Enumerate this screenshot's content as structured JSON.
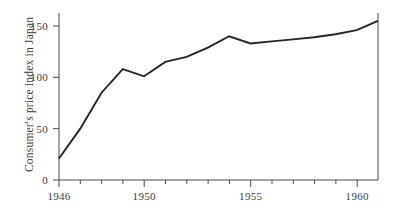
{
  "chart_data": {
    "type": "line",
    "title": "",
    "xlabel": "",
    "ylabel": "Consumer's price index in Japan",
    "x": [
      1946,
      1947,
      1948,
      1949,
      1950,
      1951,
      1952,
      1953,
      1954,
      1955,
      1956,
      1957,
      1958,
      1959,
      1960,
      1961
    ],
    "values": [
      21,
      50,
      85,
      108,
      101,
      115,
      120,
      129,
      140,
      133,
      135,
      137,
      139,
      142,
      146,
      155
    ],
    "series": [
      {
        "name": "Consumer's price index in Japan",
        "values": [
          21,
          50,
          85,
          108,
          101,
          115,
          120,
          129,
          140,
          133,
          135,
          137,
          139,
          142,
          146,
          155
        ]
      }
    ],
    "xlim": [
      1946,
      1961
    ],
    "ylim": [
      0,
      165
    ],
    "x_ticks_all": [
      1946,
      1947,
      1948,
      1949,
      1950,
      1951,
      1952,
      1953,
      1954,
      1955,
      1956,
      1957,
      1958,
      1959,
      1960,
      1961
    ],
    "x_tick_labels": [
      "1946",
      "1950",
      "1955",
      "1960"
    ],
    "x_tick_label_values": [
      1946,
      1950,
      1955,
      1960
    ],
    "y_ticks": [
      0,
      50,
      100,
      150
    ],
    "y_tick_labels": [
      "0",
      "50",
      "100",
      "150"
    ],
    "grid": false,
    "legend": false,
    "legend_position": "none",
    "line_color": "#262626",
    "axis_color": "#4a4a4a"
  },
  "axis": {
    "y_label": "Consumer's price index in Japan",
    "y_tick_0": "0",
    "y_tick_1": "50",
    "y_tick_2": "100",
    "y_tick_3": "150",
    "x_tick_0": "1946",
    "x_tick_1": "1950",
    "x_tick_2": "1955",
    "x_tick_3": "1960"
  }
}
